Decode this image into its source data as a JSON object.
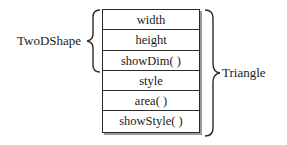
{
  "diagram": {
    "type": "class-member-stack",
    "members": [
      "width",
      "height",
      "showDim( )",
      "style",
      "area( )",
      "showStyle( )"
    ],
    "left_group": {
      "label": "TwoDShape",
      "spans_members": [
        0,
        2
      ]
    },
    "right_group": {
      "label": "Triangle",
      "spans_members": [
        0,
        5
      ]
    }
  }
}
